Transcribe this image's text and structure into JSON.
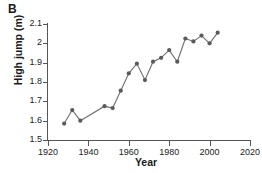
{
  "panel": {
    "label": "B"
  },
  "chart_data": {
    "type": "line",
    "title": "",
    "xlabel": "Year",
    "ylabel": "High jump (m)",
    "xlim": [
      1920,
      2020
    ],
    "ylim": [
      1.5,
      2.1
    ],
    "xticks": [
      1920,
      1940,
      1960,
      1980,
      2000,
      2020
    ],
    "xticklabels": [
      "1920",
      "1940",
      "1960",
      "1980",
      "2000",
      "2020"
    ],
    "yticks": [
      1.5,
      1.6,
      1.7,
      1.8,
      1.9,
      2.0,
      2.1
    ],
    "yticklabels": [
      "1.5",
      "1.6",
      "1.7",
      "1.8",
      "1.9",
      "2",
      "2.1"
    ],
    "grid": false,
    "legend": false,
    "marker": "circle",
    "line_color": "#6e6e6e",
    "marker_color": "#5a5a5a",
    "x": [
      1928,
      1932,
      1936,
      1948,
      1952,
      1956,
      1960,
      1964,
      1968,
      1972,
      1976,
      1980,
      1984,
      1988,
      1992,
      1996,
      2000,
      2004
    ],
    "y": [
      1.585,
      1.655,
      1.6,
      1.675,
      1.665,
      1.755,
      1.845,
      1.895,
      1.81,
      1.905,
      1.925,
      1.965,
      1.905,
      2.025,
      2.01,
      2.04,
      2.0,
      2.055
    ],
    "series": [
      {
        "name": "High jump winning height",
        "values": [
          1.585,
          1.655,
          1.6,
          1.675,
          1.665,
          1.755,
          1.845,
          1.895,
          1.81,
          1.905,
          1.925,
          1.965,
          1.905,
          2.025,
          2.01,
          2.04,
          2.0,
          2.055
        ]
      }
    ]
  }
}
